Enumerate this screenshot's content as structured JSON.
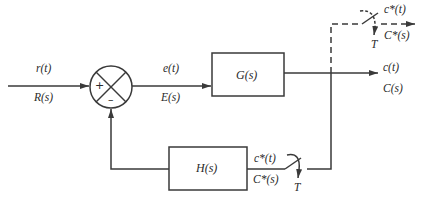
{
  "diagram": {
    "type": "sampled-data feedback control block diagram",
    "colors": {
      "line": "#3a3a3a",
      "background": "#ffffff"
    },
    "input": {
      "time_label": "r(t)",
      "laplace_label": "R(s)"
    },
    "summing_junction": {
      "plus_sign": "+",
      "minus_sign": "–"
    },
    "error": {
      "time_label": "e(t)",
      "laplace_label": "E(s)"
    },
    "forward_block": {
      "label": "G(s)"
    },
    "output": {
      "time_label": "c(t)",
      "laplace_label": "C(s)"
    },
    "output_sampler": {
      "time_label": "c*(t)",
      "laplace_label": "C*(s)",
      "period_label": "T",
      "style": "dashed"
    },
    "feedback_block": {
      "label": "H(s)"
    },
    "feedback_sampler": {
      "time_label": "c*(t)",
      "laplace_label": "C*(s)",
      "period_label": "T"
    }
  }
}
